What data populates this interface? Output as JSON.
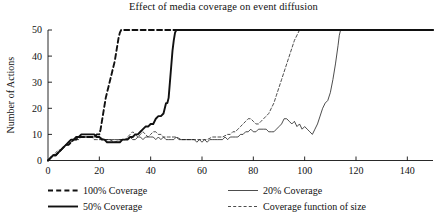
{
  "chart_data": {
    "type": "line",
    "title": "Effect of media coverage on event diffusion",
    "xlabel": "",
    "ylabel": "Number of Actions",
    "xlim": [
      0,
      150
    ],
    "ylim": [
      0,
      50
    ],
    "xticks": [
      0,
      20,
      40,
      60,
      80,
      100,
      120,
      140
    ],
    "yticks": [
      0,
      10,
      20,
      30,
      40,
      50
    ],
    "grid": false,
    "legend_position": "below-plot",
    "saturation_value": 50,
    "series": [
      {
        "name": "100% Coverage",
        "style": "dashed",
        "width": "thick",
        "color": "#111111",
        "points": [
          [
            0,
            0
          ],
          [
            1,
            1
          ],
          [
            2,
            2
          ],
          [
            3,
            2
          ],
          [
            4,
            3
          ],
          [
            5,
            4
          ],
          [
            6,
            5
          ],
          [
            7,
            6
          ],
          [
            8,
            6
          ],
          [
            9,
            7
          ],
          [
            10,
            8
          ],
          [
            11,
            8
          ],
          [
            12,
            9
          ],
          [
            13,
            9
          ],
          [
            14,
            9
          ],
          [
            15,
            9
          ],
          [
            16,
            9
          ],
          [
            17,
            9
          ],
          [
            18,
            9
          ],
          [
            19,
            10
          ],
          [
            20,
            10
          ],
          [
            20.5,
            12
          ],
          [
            21,
            15
          ],
          [
            21.5,
            18
          ],
          [
            22,
            21
          ],
          [
            22.5,
            24
          ],
          [
            23,
            26
          ],
          [
            23.5,
            28
          ],
          [
            24,
            30
          ],
          [
            24.5,
            32
          ],
          [
            25,
            34
          ],
          [
            25.5,
            36
          ],
          [
            26,
            38
          ],
          [
            26.5,
            41
          ],
          [
            27,
            44
          ],
          [
            27.5,
            47
          ],
          [
            28,
            49
          ],
          [
            28.5,
            50
          ],
          [
            29,
            50
          ],
          [
            40,
            50
          ],
          [
            60,
            50
          ],
          [
            80,
            50
          ],
          [
            100,
            50
          ],
          [
            120,
            50
          ],
          [
            150,
            50
          ]
        ]
      },
      {
        "name": "50% Coverage",
        "style": "solid",
        "width": "thick",
        "color": "#111111",
        "points": [
          [
            0,
            0
          ],
          [
            1,
            1
          ],
          [
            2,
            2
          ],
          [
            3,
            2
          ],
          [
            4,
            3
          ],
          [
            5,
            4
          ],
          [
            6,
            5
          ],
          [
            7,
            6
          ],
          [
            8,
            7
          ],
          [
            9,
            8
          ],
          [
            10,
            8
          ],
          [
            11,
            9
          ],
          [
            12,
            9
          ],
          [
            13,
            10
          ],
          [
            14,
            10
          ],
          [
            15,
            10
          ],
          [
            16,
            10
          ],
          [
            17,
            10
          ],
          [
            18,
            10
          ],
          [
            19,
            9
          ],
          [
            20,
            9
          ],
          [
            21,
            8
          ],
          [
            22,
            8
          ],
          [
            23,
            7
          ],
          [
            24,
            7
          ],
          [
            25,
            7
          ],
          [
            26,
            7
          ],
          [
            27,
            7
          ],
          [
            28,
            7
          ],
          [
            29,
            8
          ],
          [
            30,
            8
          ],
          [
            31,
            8
          ],
          [
            32,
            9
          ],
          [
            33,
            9
          ],
          [
            34,
            10
          ],
          [
            35,
            10
          ],
          [
            36,
            11
          ],
          [
            37,
            12
          ],
          [
            38,
            13
          ],
          [
            39,
            13
          ],
          [
            40,
            14
          ],
          [
            41,
            14
          ],
          [
            42,
            16
          ],
          [
            43,
            17
          ],
          [
            44,
            17
          ],
          [
            45,
            18
          ],
          [
            46,
            22
          ],
          [
            46.5,
            22
          ],
          [
            47,
            24
          ],
          [
            47.5,
            30
          ],
          [
            48,
            36
          ],
          [
            48.5,
            42
          ],
          [
            49,
            46
          ],
          [
            49.5,
            49
          ],
          [
            50,
            50
          ],
          [
            60,
            50
          ],
          [
            80,
            50
          ],
          [
            100,
            50
          ],
          [
            120,
            50
          ],
          [
            150,
            50
          ]
        ]
      },
      {
        "name": "20% Coverage",
        "style": "solid",
        "width": "thin",
        "color": "#111111",
        "points": [
          [
            0,
            0
          ],
          [
            1,
            1
          ],
          [
            2,
            2
          ],
          [
            3,
            2
          ],
          [
            4,
            3
          ],
          [
            5,
            4
          ],
          [
            6,
            5
          ],
          [
            7,
            6
          ],
          [
            8,
            6
          ],
          [
            9,
            7
          ],
          [
            10,
            8
          ],
          [
            11,
            8
          ],
          [
            12,
            9
          ],
          [
            13,
            9
          ],
          [
            14,
            9
          ],
          [
            15,
            9
          ],
          [
            16,
            9
          ],
          [
            17,
            9
          ],
          [
            18,
            9
          ],
          [
            19,
            9
          ],
          [
            20,
            9
          ],
          [
            22,
            8
          ],
          [
            24,
            8
          ],
          [
            26,
            8
          ],
          [
            28,
            8
          ],
          [
            30,
            8
          ],
          [
            32,
            9
          ],
          [
            33,
            8
          ],
          [
            34,
            8
          ],
          [
            35,
            9
          ],
          [
            36,
            9
          ],
          [
            37,
            8
          ],
          [
            38,
            9
          ],
          [
            39,
            9
          ],
          [
            40,
            9
          ],
          [
            41,
            9
          ],
          [
            42,
            8
          ],
          [
            43,
            9
          ],
          [
            44,
            8
          ],
          [
            45,
            9
          ],
          [
            46,
            8
          ],
          [
            47,
            8
          ],
          [
            48,
            8
          ],
          [
            49,
            8
          ],
          [
            50,
            9
          ],
          [
            51,
            8
          ],
          [
            52,
            8
          ],
          [
            53,
            8
          ],
          [
            54,
            8
          ],
          [
            55,
            8
          ],
          [
            56,
            8
          ],
          [
            57,
            8
          ],
          [
            58,
            7
          ],
          [
            59,
            8
          ],
          [
            60,
            7
          ],
          [
            61,
            8
          ],
          [
            62,
            7
          ],
          [
            63,
            8
          ],
          [
            64,
            8
          ],
          [
            65,
            8
          ],
          [
            66,
            8
          ],
          [
            67,
            8
          ],
          [
            68,
            8
          ],
          [
            69,
            9
          ],
          [
            70,
            8
          ],
          [
            71,
            9
          ],
          [
            72,
            9
          ],
          [
            73,
            9
          ],
          [
            74,
            9
          ],
          [
            75,
            10
          ],
          [
            76,
            10
          ],
          [
            77,
            11
          ],
          [
            78,
            11
          ],
          [
            79,
            12
          ],
          [
            80,
            11
          ],
          [
            81,
            11
          ],
          [
            82,
            12
          ],
          [
            83,
            12
          ],
          [
            84,
            12
          ],
          [
            85,
            12
          ],
          [
            86,
            11
          ],
          [
            87,
            11
          ],
          [
            88,
            11
          ],
          [
            89,
            12
          ],
          [
            90,
            13
          ],
          [
            91,
            14
          ],
          [
            92,
            16
          ],
          [
            93,
            16
          ],
          [
            94,
            15
          ],
          [
            95,
            14
          ],
          [
            96,
            15
          ],
          [
            97,
            13
          ],
          [
            98,
            14
          ],
          [
            99,
            12
          ],
          [
            100,
            13
          ],
          [
            101,
            12
          ],
          [
            102,
            11
          ],
          [
            103,
            10
          ],
          [
            104,
            12
          ],
          [
            105,
            14
          ],
          [
            106,
            17
          ],
          [
            107,
            20
          ],
          [
            108,
            22
          ],
          [
            109,
            23
          ],
          [
            110,
            26
          ],
          [
            111,
            31
          ],
          [
            112,
            37
          ],
          [
            113,
            44
          ],
          [
            113.5,
            48
          ],
          [
            114,
            50
          ],
          [
            120,
            50
          ],
          [
            130,
            50
          ],
          [
            140,
            50
          ],
          [
            150,
            50
          ]
        ]
      },
      {
        "name": "Coverage function of size",
        "style": "dashed",
        "width": "thin",
        "color": "#111111",
        "points": [
          [
            0,
            0
          ],
          [
            1,
            1
          ],
          [
            2,
            2
          ],
          [
            3,
            3
          ],
          [
            4,
            4
          ],
          [
            5,
            4
          ],
          [
            6,
            5
          ],
          [
            7,
            6
          ],
          [
            8,
            7
          ],
          [
            9,
            7
          ],
          [
            10,
            8
          ],
          [
            11,
            8
          ],
          [
            12,
            8
          ],
          [
            13,
            9
          ],
          [
            14,
            9
          ],
          [
            15,
            9
          ],
          [
            16,
            9
          ],
          [
            17,
            9
          ],
          [
            18,
            8
          ],
          [
            19,
            8
          ],
          [
            20,
            8
          ],
          [
            22,
            8
          ],
          [
            24,
            8
          ],
          [
            26,
            7
          ],
          [
            28,
            8
          ],
          [
            30,
            8
          ],
          [
            31,
            9
          ],
          [
            32,
            10
          ],
          [
            33,
            11
          ],
          [
            34,
            10
          ],
          [
            35,
            9
          ],
          [
            36,
            10
          ],
          [
            37,
            11
          ],
          [
            38,
            10
          ],
          [
            39,
            9
          ],
          [
            40,
            10
          ],
          [
            41,
            11
          ],
          [
            42,
            11
          ],
          [
            43,
            10
          ],
          [
            44,
            10
          ],
          [
            45,
            9
          ],
          [
            46,
            9
          ],
          [
            47,
            9
          ],
          [
            48,
            9
          ],
          [
            49,
            9
          ],
          [
            50,
            9
          ],
          [
            52,
            8
          ],
          [
            54,
            8
          ],
          [
            56,
            8
          ],
          [
            58,
            8
          ],
          [
            60,
            8
          ],
          [
            62,
            8
          ],
          [
            64,
            9
          ],
          [
            66,
            9
          ],
          [
            68,
            9
          ],
          [
            70,
            10
          ],
          [
            71,
            10
          ],
          [
            72,
            11
          ],
          [
            73,
            11
          ],
          [
            74,
            12
          ],
          [
            75,
            13
          ],
          [
            76,
            14
          ],
          [
            77,
            15
          ],
          [
            78,
            16
          ],
          [
            79,
            16
          ],
          [
            80,
            15
          ],
          [
            81,
            14
          ],
          [
            82,
            14
          ],
          [
            83,
            15
          ],
          [
            84,
            16
          ],
          [
            85,
            17
          ],
          [
            86,
            18
          ],
          [
            87,
            20
          ],
          [
            88,
            22
          ],
          [
            89,
            25
          ],
          [
            90,
            28
          ],
          [
            91,
            31
          ],
          [
            92,
            34
          ],
          [
            93,
            37
          ],
          [
            94,
            40
          ],
          [
            95,
            43
          ],
          [
            96,
            46
          ],
          [
            97,
            48
          ],
          [
            98,
            50
          ],
          [
            100,
            50
          ],
          [
            110,
            50
          ],
          [
            120,
            50
          ],
          [
            130,
            50
          ],
          [
            140,
            50
          ],
          [
            150,
            50
          ]
        ]
      }
    ]
  },
  "legend": {
    "entries": [
      {
        "label": "100% Coverage",
        "style": "dashed",
        "width": "thick"
      },
      {
        "label": "20% Coverage",
        "style": "solid",
        "width": "thin"
      },
      {
        "label": "50% Coverage",
        "style": "solid",
        "width": "thick"
      },
      {
        "label": "Coverage function of size",
        "style": "dashed",
        "width": "thin"
      }
    ]
  }
}
